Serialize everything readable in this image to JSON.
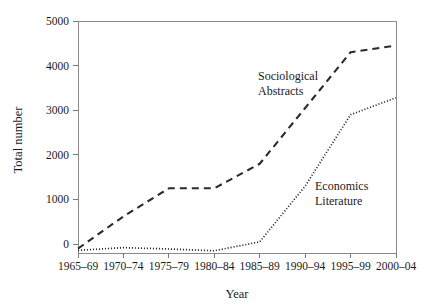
{
  "chart_data": {
    "type": "line",
    "title": "",
    "xlabel": "Year",
    "ylabel": "Total number",
    "categories": [
      "1965–69",
      "1970–74",
      "1975–79",
      "1980–84",
      "1985–89",
      "1990–94",
      "1995–99",
      "2000–04"
    ],
    "yticks": [
      0,
      1000,
      2000,
      3000,
      4000,
      5000
    ],
    "ytick_labels": [
      "0",
      "1000",
      "2000",
      "3000",
      "4000",
      "5000"
    ],
    "ylim": [
      -200,
      5000
    ],
    "grid": false,
    "legend_position": "inline-annotations",
    "series": [
      {
        "name": "Sociological Abstracts",
        "style": "dashed",
        "label_lines": [
          "Sociological",
          "Abstracts"
        ],
        "values": [
          -100,
          620,
          1250,
          1250,
          1800,
          3050,
          4300,
          4450
        ]
      },
      {
        "name": "Economics Literature",
        "style": "dotted",
        "label_lines": [
          "Economics",
          "Literature"
        ],
        "values": [
          -140,
          -80,
          -110,
          -150,
          50,
          1300,
          2900,
          3280
        ]
      }
    ],
    "colors": {
      "line": "#2b2b2b",
      "axis": "#8a8a8a",
      "text": "#1a1a1a",
      "background": "#ffffff"
    }
  }
}
